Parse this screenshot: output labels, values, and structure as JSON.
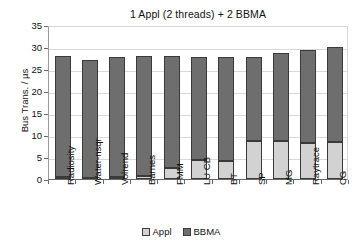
{
  "chart_data": {
    "type": "bar",
    "title": "1 Appl (2 threads) + 2 BBMA",
    "xlabel": "",
    "ylabel": "Bus Trans. / µs",
    "ylim": [
      0,
      35
    ],
    "ytick_values": [
      0,
      5,
      10,
      15,
      20,
      25,
      30,
      35
    ],
    "ytick_labels": [
      "0",
      "5",
      "10",
      "15",
      "20",
      "25",
      "30",
      "35"
    ],
    "grid": true,
    "stacked": true,
    "legend_position": "bottom-center",
    "categories": [
      "Radiosity",
      "Water-nsqr",
      "Volrend",
      "Barnes",
      "FMM",
      "LU CB",
      "BT",
      "SP",
      "MG",
      "Raytrace",
      "CG"
    ],
    "series": [
      {
        "name": "Appl",
        "color": "#d2d2d2",
        "values": [
          0.5,
          0.3,
          0.4,
          0.6,
          2.5,
          4.4,
          4.0,
          8.7,
          8.7,
          8.2,
          8.5
        ]
      },
      {
        "name": "BBMA",
        "color": "#6e6e6e",
        "values": [
          27.4,
          26.8,
          27.4,
          27.4,
          25.4,
          23.3,
          23.8,
          19.1,
          19.9,
          21.1,
          21.6
        ]
      }
    ],
    "totals": [
      27.9,
      27.1,
      27.8,
      28.0,
      27.9,
      27.7,
      27.8,
      27.8,
      28.6,
      29.3,
      30.1
    ]
  },
  "legend": {
    "items": [
      {
        "label": "Appl",
        "swatch": "legend-swatch-appl"
      },
      {
        "label": "BBMA",
        "swatch": "legend-swatch-bbma"
      }
    ]
  }
}
